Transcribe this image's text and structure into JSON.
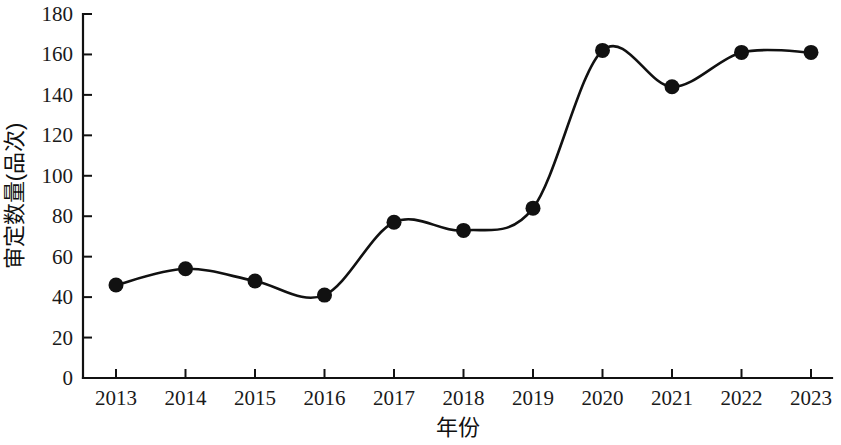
{
  "chart_data": {
    "type": "line",
    "title": "",
    "xlabel": "年份",
    "ylabel": "审定数量(品次)",
    "categories": [
      "2013",
      "2014",
      "2015",
      "2016",
      "2017",
      "2018",
      "2019",
      "2020",
      "2021",
      "2022",
      "2023"
    ],
    "values": [
      46,
      54,
      48,
      41,
      77,
      73,
      84,
      162,
      144,
      161,
      161
    ],
    "series": [
      {
        "name": "审定数量",
        "values": [
          46,
          54,
          48,
          41,
          77,
          73,
          84,
          162,
          144,
          161,
          161
        ]
      }
    ],
    "ylim": [
      0,
      180
    ],
    "y_ticks": [
      "0",
      "20",
      "40",
      "60",
      "80",
      "100",
      "120",
      "140",
      "160",
      "180"
    ],
    "x_ticks": [
      "2013",
      "2014",
      "2015",
      "2016",
      "2017",
      "2018",
      "2019",
      "2020",
      "2021",
      "2022",
      "2023"
    ],
    "grid": false,
    "legend": "none",
    "line_color": "#111111",
    "marker_color": "#111111",
    "marker_shape": "circle",
    "line_style": "smooth",
    "background_color": "#ffffff"
  }
}
